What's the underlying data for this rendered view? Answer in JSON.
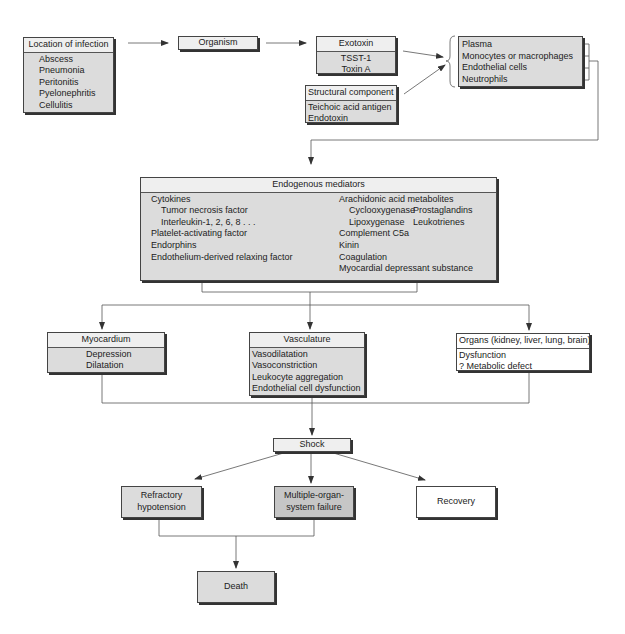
{
  "diagram": {
    "location": {
      "title": "Location of infection",
      "items": [
        "Abscess",
        "Pneumonia",
        "Peritonitis",
        "Pyelonephritis",
        "Cellulitis"
      ]
    },
    "organism": {
      "title": "Organism"
    },
    "exotoxin": {
      "title": "Exotoxin",
      "items": [
        "TSST-1",
        "Toxin A"
      ]
    },
    "structural": {
      "title": "Structural component",
      "items": [
        "Teichoic acid antigen",
        "Endotoxin"
      ]
    },
    "cells": {
      "items": [
        "Plasma",
        "Monocytes or macrophages",
        "Endothelial cells",
        "Neutrophils"
      ]
    },
    "mediators": {
      "title": "Endogenous mediators",
      "left": {
        "cytokines": "Cytokines",
        "tnf": "Tumor necrosis factor",
        "il": "Interleukin-1, 2, 6, 8 . . .",
        "paf": "Platelet-activating factor",
        "endorphins": "Endorphins",
        "edrf": "Endothelium-derived relaxing factor"
      },
      "right": {
        "arachidonic": "Arachidonic acid metabolites",
        "cox": "Cyclooxygenase",
        "prostaglandins": "Prostaglandins",
        "lox": "Lipoxygenase",
        "leukotrienes": "Leukotrienes",
        "c5a": "Complement C5a",
        "kinin": "Kinin",
        "coagulation": "Coagulation",
        "mds": "Myocardial depressant substance"
      }
    },
    "myocardium": {
      "title": "Myocardium",
      "items": [
        "Depression",
        "Dilatation"
      ]
    },
    "vasculature": {
      "title": "Vasculature",
      "items": [
        "Vasodilatation",
        "Vasoconstriction",
        "Leukocyte aggregation",
        "Endothelial cell dysfunction"
      ]
    },
    "organs": {
      "title": "Organs (kidney, liver, lung, brain)",
      "items": [
        "Dysfunction",
        "? Metabolic defect"
      ]
    },
    "shock": {
      "title": "Shock"
    },
    "refractory": {
      "line1": "Refractory",
      "line2": "hypotension"
    },
    "mosf": {
      "line1": "Multiple-organ-",
      "line2": "system failure"
    },
    "recovery": {
      "title": "Recovery"
    },
    "death": {
      "title": "Death"
    }
  }
}
